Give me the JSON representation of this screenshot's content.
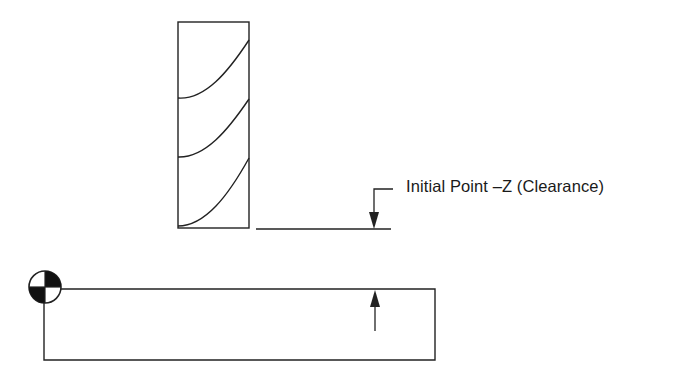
{
  "diagram": {
    "type": "cnc-milling-setup",
    "label": "Initial Point –Z (Clearance)",
    "elements": {
      "tool": {
        "name": "end-mill",
        "flutes": 3
      },
      "clearance_line": {
        "annotation": "Initial Point –Z (Clearance)"
      },
      "workpiece": {
        "name": "workpiece"
      },
      "origin": {
        "name": "work-origin-symbol"
      }
    },
    "colors": {
      "stroke": "#222222",
      "background": "#ffffff"
    }
  }
}
